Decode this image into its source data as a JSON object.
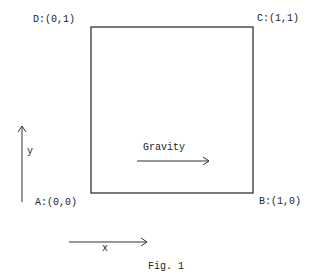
{
  "figure": {
    "caption": "Fig. 1",
    "corners": {
      "D": "D:(0,1)",
      "C": "C:(1,1)",
      "A": "A:(0,0)",
      "B": "B:(1,0)"
    },
    "gravity_label": "Gravity",
    "axes": {
      "x_label": "x",
      "y_label": "y"
    },
    "colors": {
      "ink": "#222222",
      "background": "#ffffff"
    }
  }
}
